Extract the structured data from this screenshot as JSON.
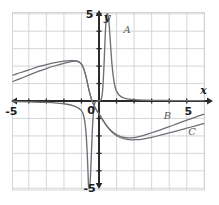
{
  "figure": {
    "background": "#ffffff",
    "grid_color": "#c9ccd1",
    "axis_color": "#2b2b2b",
    "curve_color": "#6c6f74"
  },
  "axes": {
    "x_axis_label": "x",
    "y_axis_label": "y",
    "origin_label": "0",
    "x_tick_labels": [
      {
        "text": "-5",
        "value": -5
      },
      {
        "text": "5",
        "value": 5
      }
    ],
    "y_tick_labels": [
      {
        "text": "5",
        "value": 5
      },
      {
        "text": "-5",
        "value": -5
      }
    ],
    "xlim": [
      -6,
      6
    ],
    "ylim": [
      -5.5,
      5.5
    ],
    "grid": true,
    "grid_spacing": 1
  },
  "chart_data": {
    "type": "line",
    "title": "",
    "xlabel": "x",
    "ylabel": "y",
    "xlim": [
      -6,
      6
    ],
    "ylim": [
      -5.5,
      5.5
    ],
    "grid": true,
    "legend": "inline-curve-labels",
    "annotations": [
      {
        "text": "A",
        "x": 1.6,
        "y": 3.9
      },
      {
        "text": "B",
        "x": 3.9,
        "y": -1.05
      },
      {
        "text": "C",
        "x": 5.3,
        "y": -1.95
      }
    ],
    "series": [
      {
        "name": "A",
        "label": "A",
        "description": "narrow spike: rises to +5 just right of the y-axis and plunges to -5 just left of it; approaches 0 far from the origin",
        "points": [
          [
            -6.0,
            -0.02
          ],
          [
            -5.0,
            -0.03
          ],
          [
            -4.0,
            -0.05
          ],
          [
            -3.0,
            -0.08
          ],
          [
            -2.0,
            -0.16
          ],
          [
            -1.4,
            -0.3
          ],
          [
            -1.0,
            -0.55
          ],
          [
            -0.85,
            -0.95
          ],
          [
            -0.75,
            -1.7
          ],
          [
            -0.68,
            -2.8
          ],
          [
            -0.63,
            -4.0
          ],
          [
            -0.6,
            -4.8
          ],
          [
            -0.56,
            -5.0
          ],
          [
            -0.5,
            -4.6
          ],
          [
            -0.44,
            -3.2
          ],
          [
            -0.38,
            -1.7
          ],
          [
            -0.32,
            -0.7
          ],
          [
            -0.26,
            -0.2
          ],
          [
            -0.2,
            -0.05
          ],
          [
            -0.1,
            0.0
          ],
          [
            0.1,
            0.05
          ],
          [
            0.18,
            0.35
          ],
          [
            0.24,
            1.1
          ],
          [
            0.3,
            2.4
          ],
          [
            0.36,
            3.9
          ],
          [
            0.42,
            4.8
          ],
          [
            0.48,
            5.0
          ],
          [
            0.56,
            4.6
          ],
          [
            0.64,
            3.5
          ],
          [
            0.74,
            2.1
          ],
          [
            0.86,
            1.1
          ],
          [
            1.0,
            0.55
          ],
          [
            1.25,
            0.25
          ],
          [
            1.6,
            0.12
          ],
          [
            2.2,
            0.06
          ],
          [
            3.0,
            0.04
          ],
          [
            4.0,
            0.03
          ],
          [
            5.0,
            0.02
          ],
          [
            6.0,
            0.02
          ]
        ]
      },
      {
        "name": "B",
        "label": "B",
        "description": "odd S-shaped curve: rises from lower-left, crests near x = -1.3 at about y = 2.3, falls steeply through the origin to a trough near x = 1.6 at about y = -2.1, then climbs back toward the upper right",
        "points": [
          [
            -6.0,
            1.15
          ],
          [
            -5.5,
            1.3
          ],
          [
            -5.0,
            1.45
          ],
          [
            -4.5,
            1.62
          ],
          [
            -4.0,
            1.78
          ],
          [
            -3.5,
            1.95
          ],
          [
            -3.0,
            2.08
          ],
          [
            -2.5,
            2.2
          ],
          [
            -2.0,
            2.28
          ],
          [
            -1.6,
            2.32
          ],
          [
            -1.3,
            2.3
          ],
          [
            -1.1,
            2.22
          ],
          [
            -0.95,
            2.05
          ],
          [
            -0.85,
            1.8
          ],
          [
            -0.75,
            1.45
          ],
          [
            -0.65,
            1.0
          ],
          [
            -0.55,
            0.55
          ],
          [
            -0.45,
            0.18
          ],
          [
            -0.35,
            -0.1
          ],
          [
            -0.22,
            -0.38
          ],
          [
            -0.1,
            -0.58
          ],
          [
            0.0,
            -0.72
          ],
          [
            0.2,
            -1.05
          ],
          [
            0.45,
            -1.42
          ],
          [
            0.75,
            -1.75
          ],
          [
            1.05,
            -1.95
          ],
          [
            1.35,
            -2.07
          ],
          [
            1.7,
            -2.12
          ],
          [
            2.1,
            -2.08
          ],
          [
            2.5,
            -1.98
          ],
          [
            3.0,
            -1.82
          ],
          [
            3.5,
            -1.65
          ],
          [
            4.0,
            -1.47
          ],
          [
            4.5,
            -1.28
          ],
          [
            5.0,
            -1.1
          ],
          [
            5.5,
            -0.92
          ],
          [
            6.0,
            -0.75
          ]
        ]
      },
      {
        "name": "C",
        "label": "C",
        "description": "second odd S-shaped curve lying just below B on the left and just below B on the right; same general shape with slightly smaller amplitude",
        "points": [
          [
            -6.0,
            0.72
          ],
          [
            -5.5,
            0.9
          ],
          [
            -5.0,
            1.08
          ],
          [
            -4.5,
            1.28
          ],
          [
            -4.0,
            1.48
          ],
          [
            -3.5,
            1.68
          ],
          [
            -3.0,
            1.86
          ],
          [
            -2.5,
            2.02
          ],
          [
            -2.0,
            2.16
          ],
          [
            -1.6,
            2.26
          ],
          [
            -1.3,
            2.28
          ],
          [
            -1.1,
            2.2
          ],
          [
            -0.95,
            2.03
          ],
          [
            -0.85,
            1.78
          ],
          [
            -0.75,
            1.43
          ],
          [
            -0.65,
            0.98
          ],
          [
            -0.55,
            0.53
          ],
          [
            -0.45,
            0.16
          ],
          [
            -0.35,
            -0.12
          ],
          [
            -0.22,
            -0.4
          ],
          [
            -0.1,
            -0.6
          ],
          [
            0.0,
            -0.74
          ],
          [
            0.2,
            -1.08
          ],
          [
            0.45,
            -1.46
          ],
          [
            0.75,
            -1.8
          ],
          [
            1.05,
            -2.02
          ],
          [
            1.35,
            -2.15
          ],
          [
            1.7,
            -2.22
          ],
          [
            2.1,
            -2.22
          ],
          [
            2.5,
            -2.18
          ],
          [
            3.0,
            -2.08
          ],
          [
            3.5,
            -1.96
          ],
          [
            4.0,
            -1.83
          ],
          [
            4.5,
            -1.7
          ],
          [
            5.0,
            -1.56
          ],
          [
            5.5,
            -1.42
          ],
          [
            6.0,
            -1.28
          ]
        ]
      }
    ]
  }
}
